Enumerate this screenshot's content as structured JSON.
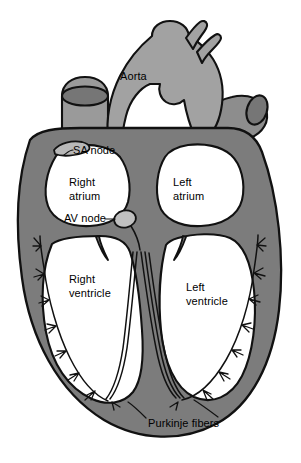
{
  "figure": {
    "type": "anatomical-diagram",
    "background_color": "#ffffff",
    "colors": {
      "myocardium": "#7c7c7c",
      "vessel_light": "#a0a0a0",
      "chamber_lumen": "#ffffff",
      "outline": "#111111",
      "node_fill": "#b4b4b4",
      "label_text": "#000000"
    }
  },
  "labels": {
    "aorta": "Aorta",
    "sa_node": "SA node",
    "av_node": "AV node",
    "right_atrium_line1": "Right",
    "right_atrium_line2": "atrium",
    "left_atrium_line1": "Left",
    "left_atrium_line2": "atrium",
    "right_ventricle_line1": "Right",
    "right_ventricle_line2": "ventricle",
    "left_ventricle_line1": "Left",
    "left_ventricle_line2": "ventricle",
    "purkinje_fibers": "Purkinje fibers"
  },
  "structures": [
    {
      "name": "aorta",
      "kind": "great-vessel"
    },
    {
      "name": "superior-vena-cava",
      "kind": "great-vessel"
    },
    {
      "name": "pulmonary-artery",
      "kind": "great-vessel"
    },
    {
      "name": "aortic-arch-branches",
      "kind": "great-vessel"
    },
    {
      "name": "sa-node",
      "kind": "conduction-node"
    },
    {
      "name": "av-node",
      "kind": "conduction-node"
    },
    {
      "name": "bundle-of-his",
      "kind": "conduction-pathway"
    },
    {
      "name": "left-bundle-branch",
      "kind": "conduction-pathway"
    },
    {
      "name": "right-bundle-branch",
      "kind": "conduction-pathway"
    },
    {
      "name": "purkinje-fibers",
      "kind": "conduction-pathway"
    },
    {
      "name": "right-atrium",
      "kind": "chamber"
    },
    {
      "name": "left-atrium",
      "kind": "chamber"
    },
    {
      "name": "right-ventricle",
      "kind": "chamber"
    },
    {
      "name": "left-ventricle",
      "kind": "chamber"
    },
    {
      "name": "interventricular-septum",
      "kind": "wall"
    }
  ]
}
